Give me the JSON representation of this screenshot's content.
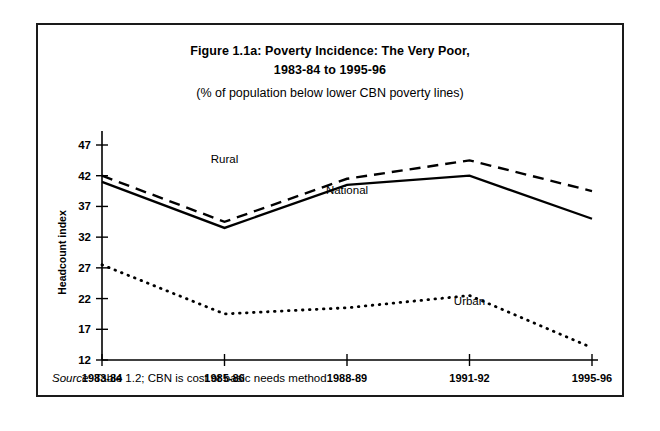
{
  "figure": {
    "title_line1": "Figure 1.1a: Poverty Incidence: The Very Poor,",
    "title_line2": "1983-84 to 1995-96",
    "subtitle": "(% of population below lower CBN poverty lines)",
    "source_word": "Source",
    "source_rest": ": Table 1.2; CBN is cost of basic needs method."
  },
  "chart_data": {
    "type": "line",
    "title": "Figure 1.1a: Poverty Incidence: The Very Poor, 1983-84 to 1995-96",
    "subtitle": "(% of population below lower CBN poverty lines)",
    "xlabel": "",
    "ylabel": "Headcount index",
    "categories": [
      "1983-84",
      "1985-86",
      "1988-89",
      "1991-92",
      "1995-96"
    ],
    "yticks": [
      12,
      17,
      22,
      27,
      32,
      37,
      42,
      47
    ],
    "ylim": [
      12,
      47
    ],
    "grid": false,
    "legend_position": "inline-annotations",
    "series": [
      {
        "name": "Rural",
        "style": "dashed",
        "color": "#000000",
        "values": [
          42.0,
          34.5,
          41.5,
          44.5,
          39.5
        ],
        "label_x_category": "1985-86",
        "label_value": 44.0
      },
      {
        "name": "National",
        "style": "solid",
        "color": "#000000",
        "values": [
          41.0,
          33.5,
          40.5,
          42.0,
          35.0
        ],
        "label_x_category": "1988-89",
        "label_value": 39.0
      },
      {
        "name": "Urban",
        "style": "dotted",
        "color": "#000000",
        "values": [
          27.5,
          19.5,
          20.5,
          22.5,
          14.0
        ],
        "label_x_category": "1991-92",
        "label_value": 21.0
      }
    ]
  }
}
